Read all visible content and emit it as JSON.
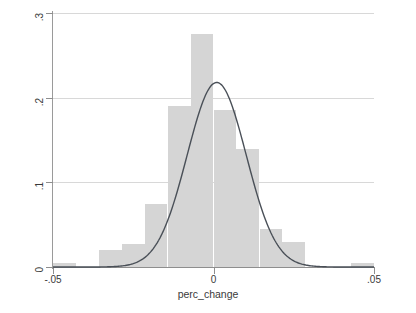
{
  "chart_data": {
    "type": "bar",
    "title": "",
    "subtitle": "",
    "xlabel": "perc_change",
    "ylabel": "",
    "xlim": [
      -0.05,
      0.05
    ],
    "ylim": [
      0,
      0.3
    ],
    "grid": true,
    "legend": null,
    "x_tick_labels": [
      "-.05",
      "0",
      ".05"
    ],
    "x_tick_values": [
      -0.05,
      0,
      0.05
    ],
    "y_tick_labels": [
      "0",
      ".1",
      ".2",
      ".3"
    ],
    "y_tick_values": [
      0,
      0.1,
      0.2,
      0.3
    ],
    "bar_width": 0.00714,
    "categories": [
      -0.0464,
      -0.0393,
      -0.0321,
      -0.025,
      -0.0179,
      -0.0107,
      -0.0036,
      0.0036,
      0.0107,
      0.0179,
      0.025,
      0.0321,
      0.0393,
      0.0464
    ],
    "values": [
      0.005,
      0.0,
      0.02,
      0.027,
      0.075,
      0.19,
      0.275,
      0.185,
      0.14,
      0.045,
      0.03,
      0.0,
      0.0,
      0.005
    ],
    "series": [
      {
        "name": "histogram",
        "type": "bar",
        "color": "#d5d5d5",
        "values": [
          0.005,
          0.0,
          0.02,
          0.027,
          0.075,
          0.19,
          0.275,
          0.185,
          0.14,
          0.045,
          0.03,
          0.0,
          0.0,
          0.005
        ]
      },
      {
        "name": "normal density",
        "type": "line",
        "color": "#4a5058",
        "peak_x": 0.001,
        "peak_y": 0.218,
        "sigma": 0.0092
      }
    ],
    "annotations": []
  },
  "axis": {
    "x_title": "perc_change"
  }
}
